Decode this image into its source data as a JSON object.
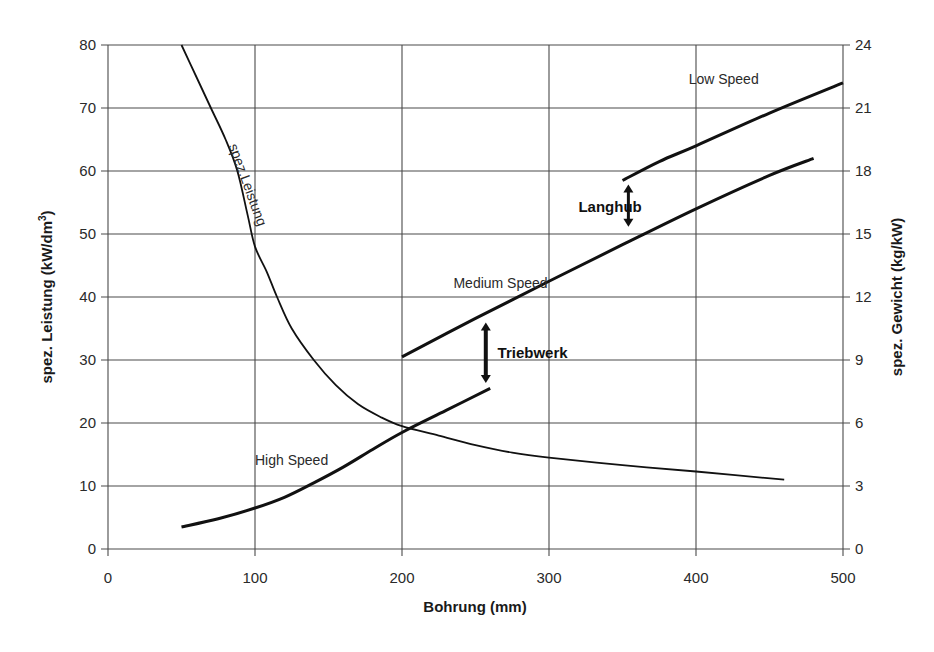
{
  "chart_data": {
    "type": "line",
    "title": "",
    "xlabel": "Bohrung (mm)",
    "ylabel": "spez. Leistung (kW/dm³)",
    "ylabel_parts": {
      "main": "spez. Leistung (kW/dm",
      "sup": "3",
      "end": ")"
    },
    "y2label": "spez. Gewicht (kg/kW)",
    "xlim": [
      0,
      500
    ],
    "ylim": [
      0,
      80
    ],
    "y2lim": [
      0,
      24
    ],
    "grid": true,
    "legend": "none (inline curve labels)",
    "x_ticks": [
      "0",
      "100",
      "200",
      "300",
      "400",
      "500"
    ],
    "y_ticks": [
      "0",
      "10",
      "20",
      "30",
      "40",
      "50",
      "60",
      "70",
      "80"
    ],
    "y2_ticks": [
      "0",
      "3",
      "6",
      "9",
      "12",
      "15",
      "18",
      "21",
      "24"
    ],
    "series": [
      {
        "name": "spez.Leistung",
        "axis": "left",
        "stroke_width": 1.8,
        "x": [
          50,
          60,
          70,
          80,
          88,
          95,
          100,
          108,
          115,
          125,
          140,
          155,
          170,
          185,
          200,
          225,
          250,
          275,
          300,
          350,
          400,
          460
        ],
        "values": [
          80,
          75,
          70,
          65,
          60,
          53,
          48,
          44,
          40,
          35,
          30,
          26,
          23,
          21,
          19.5,
          18,
          16.5,
          15.3,
          14.5,
          13.3,
          12.3,
          11
        ]
      },
      {
        "name": "High Speed",
        "axis": "right (values shown in left-axis units)",
        "stroke_width": 3,
        "x": [
          50,
          75,
          100,
          120,
          140,
          160,
          180,
          200,
          230,
          260
        ],
        "values": [
          3.5,
          4.8,
          6.5,
          8.2,
          10.5,
          13,
          15.8,
          18.5,
          22,
          25.5
        ]
      },
      {
        "name": "Medium Speed",
        "axis": "right (values shown in left-axis units)",
        "stroke_width": 3,
        "x": [
          200,
          250,
          300,
          350,
          400,
          450,
          480
        ],
        "values": [
          30.5,
          36.6,
          42.5,
          48.3,
          54,
          59.3,
          62
        ]
      },
      {
        "name": "Low Speed",
        "axis": "right (values shown in left-axis units)",
        "stroke_width": 3,
        "x": [
          350,
          375,
          400,
          450,
          500
        ],
        "values": [
          58.5,
          61.5,
          64,
          69.2,
          74
        ]
      }
    ],
    "annotations": [
      {
        "text": "spez.Leistung",
        "x": 82,
        "y": 64,
        "rotation": 70
      },
      {
        "text": "High Speed",
        "x": 100,
        "y": 13.3
      },
      {
        "text": "Medium Speed",
        "x": 235,
        "y": 41.5
      },
      {
        "text": "Low Speed",
        "x": 395,
        "y": 73.8
      },
      {
        "text": "Langhub",
        "x": 320,
        "y": 53.5,
        "bold": true,
        "arrow": {
          "x": 354,
          "from": 57.7,
          "to": 51.3
        }
      },
      {
        "text": "Triebwerk",
        "x": 265,
        "y": 30.3,
        "bold": true,
        "arrow": {
          "x": 257,
          "from": 35.8,
          "to": 26.5
        }
      }
    ]
  },
  "layout": {
    "plot": {
      "left": 108,
      "right": 843,
      "top": 45,
      "bottom": 549
    }
  },
  "colors": {
    "line": "#111111",
    "grid": "#4a4a4a",
    "text": "#2a2a2a",
    "background": "#ffffff"
  }
}
